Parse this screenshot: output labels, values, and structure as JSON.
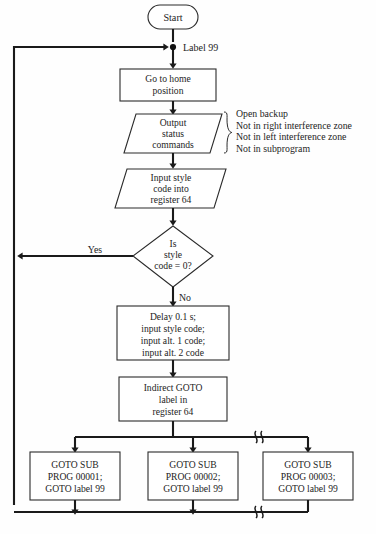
{
  "diagram": {
    "colors": {
      "line": "#1a1a1a",
      "shape_stroke": "#2b2b2b",
      "shape_fill": "#ffffff",
      "text": "#1d1d1d",
      "background": "#fefefe"
    },
    "nodes": {
      "start": {
        "shape": "terminator",
        "label": "Start"
      },
      "label99_junction": {
        "shape": "junction",
        "label": "Label 99"
      },
      "go_home": {
        "shape": "process",
        "lines": [
          "Go to home",
          "position"
        ]
      },
      "output_status": {
        "shape": "parallelogram",
        "lines": [
          "Output",
          "status",
          "commands"
        ]
      },
      "input_style": {
        "shape": "parallelogram",
        "lines": [
          "Input style",
          "code into",
          "register 64"
        ]
      },
      "decision": {
        "shape": "diamond",
        "lines": [
          "Is",
          "style",
          "code = 0?"
        ],
        "yes_label": "Yes",
        "no_label": "No"
      },
      "delay": {
        "shape": "process",
        "lines": [
          "Delay 0.1 s;",
          "input style code;",
          "input alt. 1 code;",
          "input alt. 2 code"
        ]
      },
      "indirect_goto": {
        "shape": "process",
        "lines": [
          "Indirect GOTO",
          "label in",
          "register 64"
        ]
      },
      "sub1": {
        "shape": "process",
        "lines": [
          "GOTO SUB",
          "PROG 00001;",
          "GOTO label 99"
        ]
      },
      "sub2": {
        "shape": "process",
        "lines": [
          "GOTO SUB",
          "PROG 00002;",
          "GOTO label 99"
        ]
      },
      "sub3": {
        "shape": "process",
        "lines": [
          "GOTO SUB",
          "PROG 00003;",
          "GOTO label 99"
        ]
      }
    },
    "annotation": {
      "brace": "}",
      "lines": [
        "Open backup",
        "Not in right interference zone",
        "Not in left interference zone",
        "Not in subprogram"
      ]
    }
  }
}
